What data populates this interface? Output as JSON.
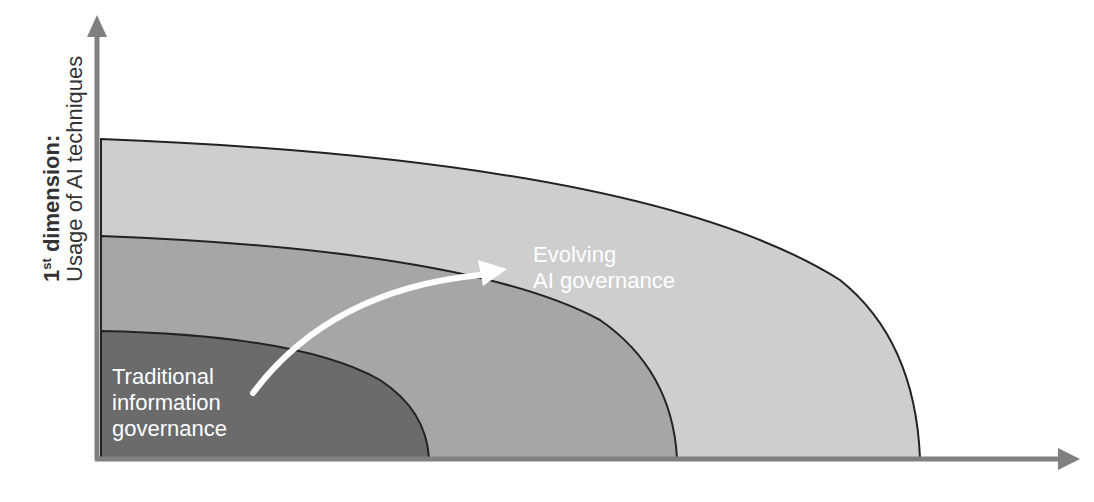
{
  "diagram": {
    "y_axis": {
      "label_line1_prefix": "1",
      "label_line1_sup": "st",
      "label_line1_rest": " dimension:",
      "label_line2": "Usage of AI techniques"
    },
    "x_axis": {
      "label": ""
    },
    "regions": [
      {
        "name": "outer",
        "color": "#cecece"
      },
      {
        "name": "middle",
        "color": "#a6a6a6"
      },
      {
        "name": "inner",
        "color": "#6b6b6b"
      }
    ],
    "labels": {
      "traditional": [
        "Traditional",
        "information",
        "governance"
      ],
      "evolving": [
        "Evolving",
        "AI governance"
      ]
    },
    "colors": {
      "axis": "#808080",
      "outline": "#222222",
      "arrow": "#ffffff"
    }
  }
}
